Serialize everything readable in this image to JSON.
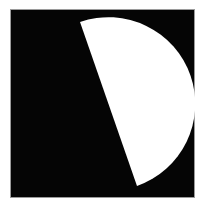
{
  "image": {
    "width": 202,
    "height": 206,
    "background_color": "#ffffff",
    "caption": "black square panel containing a white half-disc shape"
  },
  "panel": {
    "name": "black-square-panel",
    "fill_color": "#050505",
    "border_color": "#9a9a9a",
    "x": 11,
    "y": 10,
    "width": 183,
    "height": 187
  },
  "figure": {
    "name": "half-disc-shape",
    "kind": "circular-segment",
    "fill_color": "#ffffff",
    "chord_start": {
      "x": 80,
      "y": 22
    },
    "chord_end": {
      "x": 137,
      "y": 186
    },
    "arc_extreme_right": {
      "x": 183,
      "y": 101
    },
    "arc_radius_x": 74,
    "arc_radius_y": 84,
    "path": "M 80 22 L 137 186 A 84 84 0 0 0 80 22 Z"
  }
}
